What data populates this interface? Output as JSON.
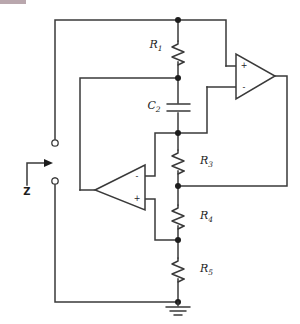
{
  "figure": {
    "type": "circuit-diagram",
    "port_label": "Z",
    "ground_label": "ground"
  },
  "components": [
    {
      "id": "R1",
      "name": "R",
      "subscript": "1",
      "kind": "resistor",
      "orientation": "vertical"
    },
    {
      "id": "C2",
      "name": "C",
      "subscript": "2",
      "kind": "capacitor",
      "orientation": "vertical"
    },
    {
      "id": "R3",
      "name": "R",
      "subscript": "3",
      "kind": "resistor",
      "orientation": "vertical"
    },
    {
      "id": "R4",
      "name": "R",
      "subscript": "4",
      "kind": "resistor",
      "orientation": "vertical"
    },
    {
      "id": "R5",
      "name": "R",
      "subscript": "5",
      "kind": "resistor",
      "orientation": "vertical"
    }
  ],
  "opamps": [
    {
      "id": "A1",
      "position": "top-right",
      "facing": "right",
      "plus_pin": "+",
      "minus_pin": "-",
      "plus_location": "upper",
      "minus_location": "lower"
    },
    {
      "id": "A2",
      "position": "bottom-left",
      "facing": "left",
      "plus_pin": "+",
      "minus_pin": "-",
      "plus_location": "lower",
      "minus_location": "upper"
    }
  ],
  "terminals": [
    {
      "id": "T1",
      "label": "",
      "role": "input-top"
    },
    {
      "id": "T2",
      "label": "",
      "role": "input-bottom"
    }
  ],
  "annotations": {
    "impedance_arrow": "Z"
  }
}
